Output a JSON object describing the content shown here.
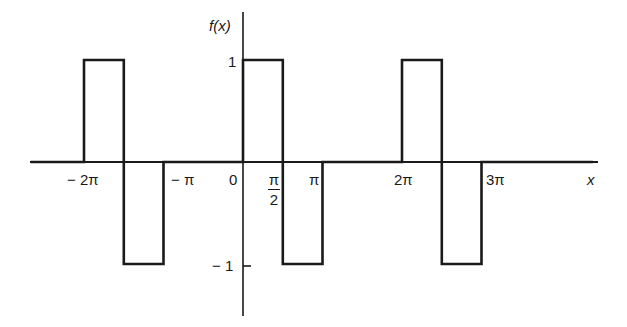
{
  "chart_data": {
    "type": "line",
    "title": "",
    "xlabel": "x",
    "ylabel": "f(x)",
    "x_tick_labels": [
      "−2π",
      "−π",
      "0",
      "π/2",
      "π",
      "2π",
      "3π"
    ],
    "x_tick_values_in_pi": [
      -2,
      -1,
      0,
      0.5,
      1,
      2,
      3
    ],
    "y_tick_labels": [
      "1",
      "−1"
    ],
    "y_tick_values": [
      1,
      -1
    ],
    "xlim_in_pi": [
      -2.67,
      4.4
    ],
    "ylim": [
      -1.54,
      1.5
    ],
    "grid": false,
    "legend": null,
    "series": [
      {
        "name": "f(x)",
        "x_in_pi": [
          -2.67,
          -2,
          -2,
          -1.5,
          -1.5,
          -1,
          -1,
          0,
          0,
          0.5,
          0.5,
          1,
          1,
          2,
          2,
          2.5,
          2.5,
          3,
          3,
          4.4
        ],
        "y": [
          0,
          0,
          1,
          1,
          -1,
          -1,
          0,
          0,
          1,
          1,
          -1,
          -1,
          0,
          0,
          1,
          1,
          -1,
          -1,
          0,
          0
        ]
      }
    ]
  },
  "labels": {
    "y_axis": "f(x)",
    "x_axis": "x",
    "y_one": "1",
    "y_neg_one": "− 1",
    "x_neg_2pi": "− 2π",
    "x_neg_pi": "− π",
    "x_zero": "0",
    "x_half_pi_num": "π",
    "x_half_pi_den": "2",
    "x_pi": "π",
    "x_2pi": "2π",
    "x_3pi": "3π"
  }
}
